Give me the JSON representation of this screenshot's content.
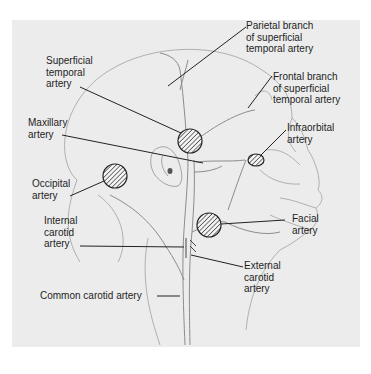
{
  "figure": {
    "type": "anatomical illustration",
    "labels": {
      "parietal_branch": "Parietal branch\nof superficial\ntemporal artery",
      "superficial_temporal": "Superficial\ntemporal\nartery",
      "frontal_branch": "Frontal branch\nof superficial\ntemporal artery",
      "maxillary": "Maxillary\nartery",
      "infraorbital": "Infraorbital\nartery",
      "occipital": "Occipital\nartery",
      "facial": "Facial\nartery",
      "internal_carotid": "Internal\ncarotid\nartery",
      "external_carotid": "External\ncarotid\nartery",
      "common_carotid": "Common carotid artery"
    },
    "pulse_points": [
      "superficial temporal",
      "occipital",
      "infraorbital",
      "facial"
    ],
    "caption_cutoff": ""
  },
  "colors": {
    "plate": "#ececec",
    "ink": "#1e1e1e",
    "sketch": "#9a9a9a"
  }
}
